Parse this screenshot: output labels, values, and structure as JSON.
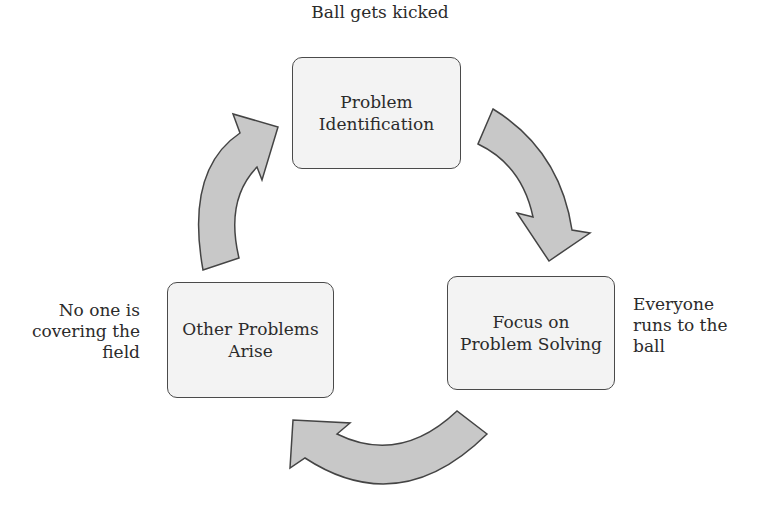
{
  "diagram": {
    "type": "cycle",
    "colors": {
      "box_fill": "#f3f3f3",
      "box_border": "#4a4a4a",
      "arrow_fill": "#c8c8c8",
      "arrow_stroke": "#444444",
      "text": "#2b2b2b"
    },
    "nodes": [
      {
        "id": "problem-identification",
        "lines": [
          "Problem",
          "Identification"
        ],
        "annotation": [
          "Ball gets kicked"
        ]
      },
      {
        "id": "focus-on-problem-solving",
        "lines": [
          "Focus on",
          "Problem Solving"
        ],
        "annotation": [
          "Everyone",
          "runs to the",
          "ball"
        ]
      },
      {
        "id": "other-problems-arise",
        "lines": [
          "Other Problems",
          "Arise"
        ],
        "annotation": [
          "No one is",
          "covering the",
          "field"
        ]
      }
    ],
    "edges": [
      {
        "from": "problem-identification",
        "to": "focus-on-problem-solving",
        "direction": "clockwise"
      },
      {
        "from": "focus-on-problem-solving",
        "to": "other-problems-arise",
        "direction": "clockwise"
      },
      {
        "from": "other-problems-arise",
        "to": "problem-identification",
        "direction": "clockwise"
      }
    ]
  }
}
